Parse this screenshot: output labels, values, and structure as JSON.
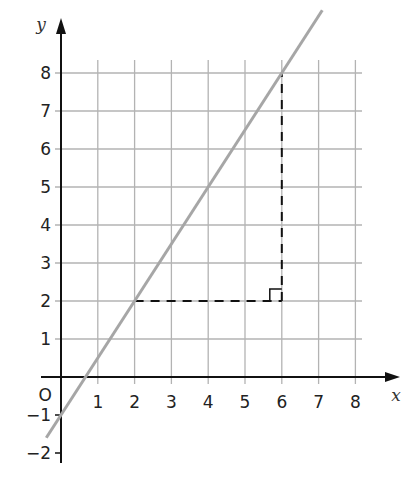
{
  "chart_data": {
    "type": "line",
    "title": "",
    "xlabel": "x",
    "ylabel": "y",
    "origin_label": "O",
    "xlim": [
      0,
      8
    ],
    "ylim": [
      -2,
      8
    ],
    "grid": true,
    "x_ticks": [
      1,
      2,
      3,
      4,
      5,
      6,
      7,
      8
    ],
    "y_ticks": [
      -2,
      -1,
      1,
      2,
      3,
      4,
      5,
      6,
      7,
      8
    ],
    "x_tick_labels": [
      "1",
      "2",
      "3",
      "4",
      "5",
      "6",
      "7",
      "8"
    ],
    "y_tick_labels": [
      "−2",
      "−1",
      "1",
      "2",
      "3",
      "4",
      "5",
      "6",
      "7",
      "8"
    ],
    "series": [
      {
        "name": "line",
        "equation": "y = 1.5x - 1",
        "x": [
          -0.4,
          7.1
        ],
        "y": [
          -1.6,
          9.65
        ],
        "color": "#a6a6a6"
      }
    ],
    "annotations": [
      {
        "type": "dashed-segment",
        "from": [
          2,
          2
        ],
        "to": [
          6,
          2
        ],
        "label": "run"
      },
      {
        "type": "dashed-segment",
        "from": [
          6,
          2
        ],
        "to": [
          6,
          8
        ],
        "label": "rise"
      },
      {
        "type": "right-angle-marker",
        "at": [
          6,
          2
        ]
      }
    ],
    "colors": {
      "grid": "#b3b3b3",
      "axis": "#111111",
      "line": "#a6a6a6",
      "dashed": "#111111"
    }
  }
}
